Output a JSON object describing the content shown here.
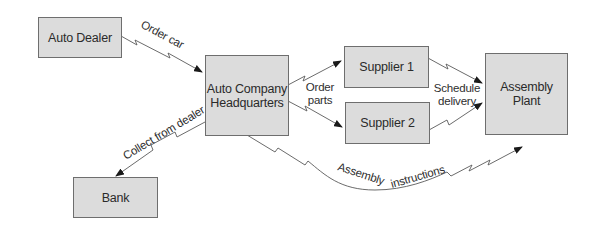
{
  "diagram": {
    "nodes": {
      "auto_dealer": {
        "label": "Auto Dealer"
      },
      "hq": {
        "line1": "Auto Company",
        "line2": "Headquarters"
      },
      "supplier1": {
        "label": "Supplier 1"
      },
      "supplier2": {
        "label": "Supplier 2"
      },
      "assembly_plant": {
        "line1": "Assembly",
        "line2": "Plant"
      },
      "bank": {
        "label": "Bank"
      }
    },
    "edges": {
      "order_car": {
        "label": "Order car",
        "from": "Auto Dealer",
        "to": "Auto Company Headquarters"
      },
      "order_parts": {
        "line1": "Order",
        "line2": "parts",
        "from": "Auto Company Headquarters",
        "to": [
          "Supplier 1",
          "Supplier 2"
        ]
      },
      "schedule_delivery": {
        "line1": "Schedule",
        "line2": "delivery",
        "from": [
          "Supplier 1",
          "Supplier 2"
        ],
        "to": "Assembly Plant"
      },
      "collect_from_dealer": {
        "label": "Collect from dealer",
        "from": "Auto Company Headquarters",
        "to": "Bank"
      },
      "assembly_instructions": {
        "label1": "Assembly",
        "label2": "instructions",
        "from": "Auto Company Headquarters",
        "to": "Assembly Plant"
      }
    },
    "colors": {
      "box_fill": "#dcdcdc",
      "box_border": "#6e6e6e",
      "line": "#555555",
      "arrowhead": "#1a1a1a",
      "text": "#2a2a2a"
    }
  }
}
